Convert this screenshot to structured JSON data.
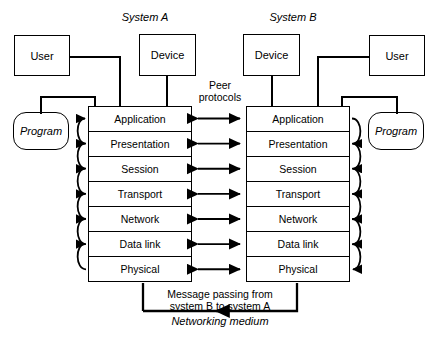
{
  "figure": {
    "systems": [
      {
        "id": "A",
        "label": "System A"
      },
      {
        "id": "B",
        "label": "System B"
      }
    ],
    "nodes": {
      "user_a": "User",
      "device_a": "Device",
      "device_b": "Device",
      "user_b": "User",
      "program_a": "Program",
      "program_b": "Program"
    },
    "layers": [
      "Application",
      "Presentation",
      "Session",
      "Transport",
      "Network",
      "Data link",
      "Physical"
    ],
    "annotations": {
      "peer_protocols_line1": "Peer",
      "peer_protocols_line2": "protocols",
      "message_line1": "Message passing from",
      "message_line2": "system B to system A",
      "networking_medium": "Networking medium"
    },
    "colors": {
      "stroke": "#000000",
      "background": "#ffffff",
      "divider": "#000000"
    }
  }
}
